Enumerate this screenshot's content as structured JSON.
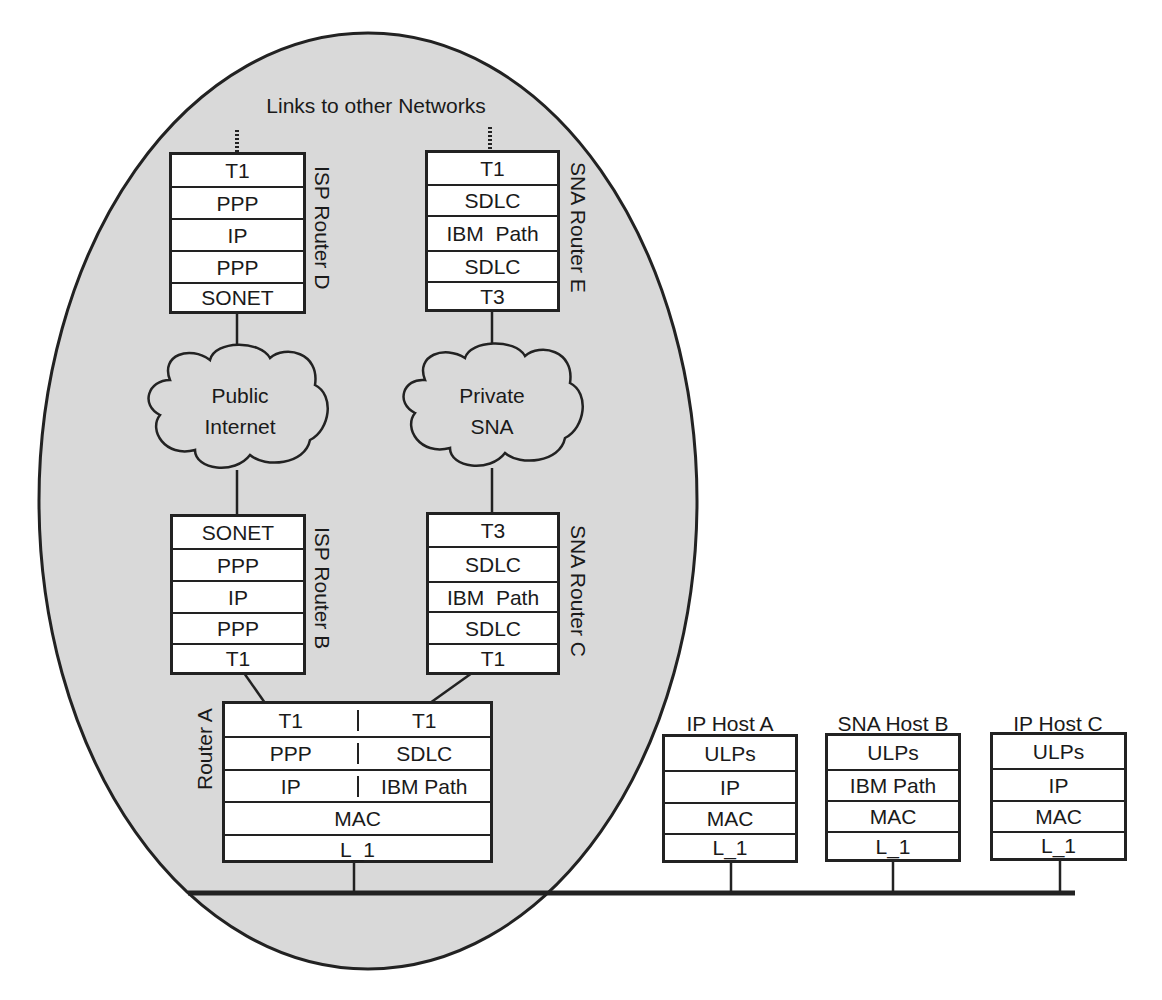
{
  "diagram": {
    "top_label": "Links to other Networks",
    "domain_region": "shaded ellipse enclosing routers and clouds",
    "routers": {
      "isp_router_d": {
        "label": "ISP Router D",
        "layers": [
          "T1",
          "PPP",
          "IP",
          "PPP",
          "SONET"
        ]
      },
      "sna_router_e": {
        "label": "SNA Router E",
        "layers": [
          "T1",
          "SDLC",
          "IBM  Path",
          "SDLC",
          "T3"
        ]
      },
      "isp_router_b": {
        "label": "ISP Router B",
        "layers": [
          "SONET",
          "PPP",
          "IP",
          "PPP",
          "T1"
        ]
      },
      "sna_router_c": {
        "label": "SNA Router C",
        "layers": [
          "T3",
          "SDLC",
          "IBM  Path",
          "SDLC",
          "T1"
        ]
      },
      "router_a": {
        "label": "Router A",
        "left_layers": [
          "T1",
          "PPP",
          "IP"
        ],
        "right_layers": [
          "T1",
          "SDLC",
          "IBM Path"
        ],
        "shared_layers": [
          "MAC",
          "L_1"
        ]
      }
    },
    "clouds": {
      "public": {
        "line1": "Public",
        "line2": "Internet"
      },
      "private": {
        "line1": "Private",
        "line2": "SNA"
      }
    },
    "hosts": [
      {
        "label": "IP Host A",
        "layers": [
          "ULPs",
          "IP",
          "MAC",
          "L_1"
        ]
      },
      {
        "label": "SNA Host B",
        "layers": [
          "ULPs",
          "IBM Path",
          "MAC",
          "L_1"
        ]
      },
      {
        "label": "IP Host C",
        "layers": [
          "ULPs",
          "IP",
          "MAC",
          "L_1"
        ]
      }
    ],
    "colors": {
      "ellipse_fill": "#d9d9d9",
      "stroke": "#222222",
      "box_fill": "#ffffff"
    }
  }
}
